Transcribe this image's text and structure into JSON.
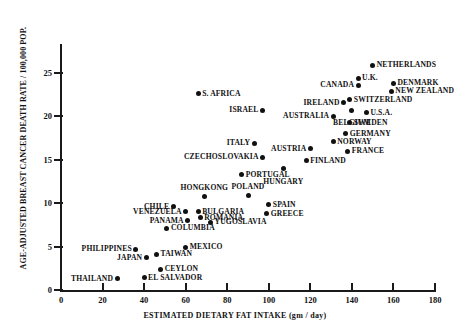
{
  "chart_data": {
    "type": "scatter",
    "title": "",
    "xlabel": "ESTIMATED DIETARY FAT INTAKE (gm / day)",
    "ylabel": "AGE-ADJUSTED BREAST CANCER DEATH RATE / 100,000 POP.",
    "xlim": [
      0,
      180
    ],
    "ylim": [
      0,
      28
    ],
    "xticks": [
      0,
      20,
      40,
      60,
      80,
      100,
      120,
      140,
      160,
      180
    ],
    "yticks": [
      0,
      5,
      10,
      15,
      20,
      25
    ],
    "grid": false,
    "legend": false,
    "points": [
      {
        "label": "NETHERLANDS",
        "x": 150,
        "y": 25.9,
        "side": "right"
      },
      {
        "label": "U.K.",
        "x": 143,
        "y": 24.4,
        "side": "right"
      },
      {
        "label": "DENMARK",
        "x": 160,
        "y": 23.8,
        "side": "right"
      },
      {
        "label": "CANADA",
        "x": 143,
        "y": 23.6,
        "side": "left"
      },
      {
        "label": "NEW ZEALAND",
        "x": 159,
        "y": 22.9,
        "side": "right"
      },
      {
        "label": "SWITZERLAND",
        "x": 139,
        "y": 21.9,
        "side": "right"
      },
      {
        "label": "IRELAND",
        "x": 136,
        "y": 21.6,
        "side": "left"
      },
      {
        "label": "S. AFRICA",
        "x": 66,
        "y": 22.6,
        "side": "right"
      },
      {
        "label": "ISRAEL",
        "x": 97,
        "y": 20.7,
        "side": "left"
      },
      {
        "label": "BELGIUM",
        "x": 140,
        "y": 20.7,
        "side": "below"
      },
      {
        "label": "U.S.A.",
        "x": 147,
        "y": 20.4,
        "side": "right"
      },
      {
        "label": "AUSTRALIA",
        "x": 131,
        "y": 20.0,
        "side": "left"
      },
      {
        "label": "SWEDEN",
        "x": 139,
        "y": 19.3,
        "side": "right"
      },
      {
        "label": "GERMANY",
        "x": 137,
        "y": 18.0,
        "side": "right"
      },
      {
        "label": "NORWAY",
        "x": 131,
        "y": 17.1,
        "side": "right"
      },
      {
        "label": "ITALY",
        "x": 93,
        "y": 16.9,
        "side": "left"
      },
      {
        "label": "AUSTRIA",
        "x": 120,
        "y": 16.3,
        "side": "left"
      },
      {
        "label": "FRANCE",
        "x": 138,
        "y": 16.0,
        "side": "right"
      },
      {
        "label": "CZECHOSLOVAKIA",
        "x": 97,
        "y": 15.3,
        "side": "left"
      },
      {
        "label": "FINLAND",
        "x": 118,
        "y": 14.9,
        "side": "right"
      },
      {
        "label": "HUNGARY",
        "x": 107,
        "y": 14.0,
        "side": "below"
      },
      {
        "label": "PORTUGAL",
        "x": 87,
        "y": 13.3,
        "side": "right"
      },
      {
        "label": "POLAND",
        "x": 90,
        "y": 10.9,
        "side": "above"
      },
      {
        "label": "HONGKONG",
        "x": 69,
        "y": 10.8,
        "side": "above"
      },
      {
        "label": "SPAIN",
        "x": 100,
        "y": 9.8,
        "side": "right"
      },
      {
        "label": "CHILE",
        "x": 54,
        "y": 9.6,
        "side": "left"
      },
      {
        "label": "BULGARIA",
        "x": 66,
        "y": 9.0,
        "side": "right"
      },
      {
        "label": "VENEZUELA",
        "x": 60,
        "y": 9.0,
        "side": "left"
      },
      {
        "label": "GREECE",
        "x": 99,
        "y": 8.8,
        "side": "right"
      },
      {
        "label": "ROMANIA",
        "x": 67,
        "y": 8.3,
        "side": "right"
      },
      {
        "label": "PANAMA",
        "x": 61,
        "y": 8.0,
        "side": "left"
      },
      {
        "label": "YUGOSLAVIA",
        "x": 72,
        "y": 7.8,
        "side": "right"
      },
      {
        "label": "COLUMBIA",
        "x": 51,
        "y": 7.1,
        "side": "right"
      },
      {
        "label": "MEXICO",
        "x": 60,
        "y": 4.9,
        "side": "right"
      },
      {
        "label": "PHILIPPINES",
        "x": 36,
        "y": 4.7,
        "side": "left"
      },
      {
        "label": "TAIWAN",
        "x": 46,
        "y": 4.1,
        "side": "right"
      },
      {
        "label": "JAPAN",
        "x": 41,
        "y": 3.7,
        "side": "left"
      },
      {
        "label": "CEYLON",
        "x": 48,
        "y": 2.4,
        "side": "right"
      },
      {
        "label": "EL SALVADOR",
        "x": 40,
        "y": 1.4,
        "side": "right"
      },
      {
        "label": "THAILAND",
        "x": 27,
        "y": 1.3,
        "side": "left"
      }
    ]
  }
}
